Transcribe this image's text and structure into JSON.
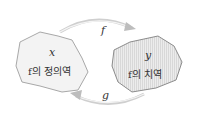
{
  "diagram": {
    "domain_set": {
      "variable": "x",
      "label": "f의 정의역",
      "fill": "#f2f2f2",
      "stroke": "#a8a8a8"
    },
    "codomain_set": {
      "variable": "y",
      "label": "f의 치역",
      "fill": "#e6e6e6",
      "stroke": "#8c8c8c"
    },
    "arrows": [
      {
        "label": "f",
        "from": "domain_set",
        "to": "codomain_set",
        "position": "top"
      },
      {
        "label": "g",
        "from": "codomain_set",
        "to": "domain_set",
        "position": "bottom"
      }
    ],
    "arrow_color": "#c8c8c8"
  }
}
